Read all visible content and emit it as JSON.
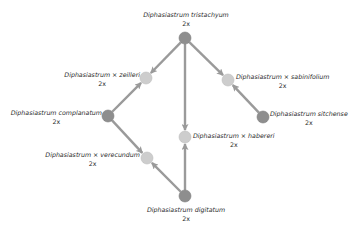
{
  "diagram": {
    "type": "hybridization-network",
    "colors": {
      "parent_node": "#8e8e8e",
      "hybrid_node": "#cdcdcd",
      "edge": "#9a9a9a",
      "text": "#2a2a2a",
      "background": "#ffffff"
    },
    "nodes": [
      {
        "id": "tristachyum",
        "name": "Diphasiastrum tristachyum",
        "ploidy": "2x",
        "kind": "parent",
        "x": 185,
        "y": 38
      },
      {
        "id": "zeilleri",
        "name": "Diphasiastrum × zeilleri",
        "ploidy": "2x",
        "kind": "hybrid",
        "x": 146,
        "y": 78
      },
      {
        "id": "sabinifolium",
        "name": "Diphasiastrum × sabinifolium",
        "ploidy": "2x",
        "kind": "hybrid",
        "x": 228,
        "y": 80
      },
      {
        "id": "complanatum",
        "name": "Diphasiastrum complanatum",
        "ploidy": "2x",
        "kind": "parent",
        "x": 108,
        "y": 116
      },
      {
        "id": "sitchense",
        "name": "Diphasiastrum sitchense",
        "ploidy": "2x",
        "kind": "parent",
        "x": 263,
        "y": 117
      },
      {
        "id": "habereri",
        "name": "Diphasiastrum × habereri",
        "ploidy": "2x",
        "kind": "hybrid",
        "x": 185,
        "y": 137
      },
      {
        "id": "verecundum",
        "name": "Diphasiastrum × verecundum",
        "ploidy": "2x",
        "kind": "hybrid",
        "x": 147,
        "y": 158
      },
      {
        "id": "digitatum",
        "name": "Diphasiastrum digitatum",
        "ploidy": "2x",
        "kind": "parent",
        "x": 185,
        "y": 196
      }
    ],
    "edges": [
      {
        "from": "tristachyum",
        "to": "zeilleri"
      },
      {
        "from": "tristachyum",
        "to": "sabinifolium"
      },
      {
        "from": "tristachyum",
        "to": "habereri"
      },
      {
        "from": "complanatum",
        "to": "zeilleri"
      },
      {
        "from": "complanatum",
        "to": "verecundum"
      },
      {
        "from": "sitchense",
        "to": "sabinifolium"
      },
      {
        "from": "digitatum",
        "to": "habereri"
      },
      {
        "from": "digitatum",
        "to": "verecundum"
      }
    ]
  },
  "labels": {
    "tristachyum": {
      "name": "Diphasiastrum tristachyum",
      "ploidy": "2x"
    },
    "zeilleri": {
      "name": "Diphasiastrum × zeilleri",
      "ploidy": "2x"
    },
    "sabinifolium": {
      "name": "Diphasiastrum × sabinifolium",
      "ploidy": "2x"
    },
    "complanatum": {
      "name": "Diphasiastrum complanatum",
      "ploidy": "2x"
    },
    "sitchense": {
      "name": "Diphasiastrum sitchense",
      "ploidy": "2x"
    },
    "habereri": {
      "name": "Diphasiastrum × habereri",
      "ploidy": "2x"
    },
    "verecundum": {
      "name": "Diphasiastrum × verecundum",
      "ploidy": "2x"
    },
    "digitatum": {
      "name": "Diphasiastrum digitatum",
      "ploidy": "2x"
    }
  }
}
